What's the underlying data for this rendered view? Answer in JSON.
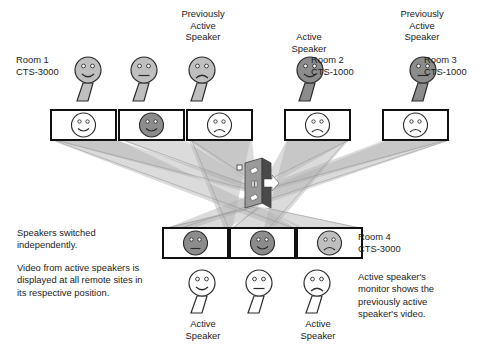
{
  "diagram": {
    "colors": {
      "light_gray": "#bfbfbf",
      "dark_gray": "#8c8c8c",
      "white": "#ffffff",
      "outline": "#2b2b2b",
      "beam": "#b8b8b8",
      "switch_dark": "#4a4a4a",
      "switch_light": "#9a9a9a"
    },
    "room_labels": [
      {
        "id": "room1",
        "text": "Room 1\nCTS-3000",
        "x": 16,
        "y": 54,
        "align": "left"
      },
      {
        "id": "room2",
        "text": "Room 2\nCTS-1000",
        "x": 311,
        "y": 54,
        "align": "left"
      },
      {
        "id": "room3",
        "text": "Room 3\nCTS-1000",
        "x": 424,
        "y": 54,
        "align": "left"
      },
      {
        "id": "room4",
        "text": "Room 4\nCTS-3000",
        "x": 358,
        "y": 231,
        "align": "left"
      }
    ],
    "speaker_captions": [
      {
        "id": "prev-active-top-mid",
        "text": "Previously\nActive\nSpeaker",
        "x": 163,
        "y": 8,
        "w": 80
      },
      {
        "id": "active-top-room2",
        "text": "Active\nSpeaker",
        "x": 269,
        "y": 31,
        "w": 80
      },
      {
        "id": "prev-active-top-room3",
        "text": "Previously\nActive\nSpeaker",
        "x": 382,
        "y": 8,
        "w": 80
      },
      {
        "id": "active-bottom-left",
        "text": "Active\nSpeaker",
        "x": 163,
        "y": 318,
        "w": 80
      },
      {
        "id": "active-bottom-right",
        "text": "Active\nSpeaker",
        "x": 278,
        "y": 318,
        "w": 80
      }
    ],
    "notes": [
      {
        "id": "note-switching",
        "text": "Speakers switched\nindependently.",
        "x": 17,
        "y": 227,
        "w": 180
      },
      {
        "id": "note-video-display",
        "text": "Video from active speakers is\ndisplayed at all remote sites in\nits respective position.",
        "x": 17,
        "y": 262,
        "w": 195
      },
      {
        "id": "note-active-monitor",
        "text": "Active speaker's\nmonitor shows the\npreviously active\nspeaker's video.",
        "x": 358,
        "y": 271,
        "w": 140
      }
    ],
    "top_people": [
      {
        "id": "person-room1",
        "x": 88,
        "y": 58,
        "fill": "light",
        "mouth": "smile"
      },
      {
        "id": "person-top-2",
        "x": 144,
        "y": 58,
        "fill": "light",
        "mouth": "neutral"
      },
      {
        "id": "person-top-3",
        "x": 202,
        "y": 58,
        "fill": "light",
        "mouth": "frown"
      },
      {
        "id": "person-room2",
        "x": 310,
        "y": 58,
        "fill": "dark",
        "mouth": "smile"
      },
      {
        "id": "person-room3",
        "x": 423,
        "y": 58,
        "fill": "dark",
        "mouth": "neutral"
      }
    ],
    "top_monitors": [
      {
        "id": "monitor-top-1",
        "x": 51,
        "y": 110,
        "face": "white",
        "mouth": "smile"
      },
      {
        "id": "monitor-top-2",
        "x": 119,
        "y": 110,
        "face": "dark",
        "mouth": "smile"
      },
      {
        "id": "monitor-top-3",
        "x": 187,
        "y": 110,
        "face": "white",
        "mouth": "frown"
      },
      {
        "id": "monitor-top-4",
        "x": 285,
        "y": 110,
        "face": "white",
        "mouth": "frown"
      },
      {
        "id": "monitor-top-5",
        "x": 383,
        "y": 110,
        "face": "white",
        "mouth": "frown"
      }
    ],
    "bottom_monitors": [
      {
        "id": "monitor-room4-1",
        "x": 163,
        "y": 228,
        "face": "dark",
        "mouth": "neutral"
      },
      {
        "id": "monitor-room4-2",
        "x": 230,
        "y": 228,
        "face": "dark",
        "mouth": "smile"
      },
      {
        "id": "monitor-room4-3",
        "x": 297,
        "y": 228,
        "face": "light",
        "mouth": "frown"
      }
    ],
    "bottom_people": [
      {
        "id": "person-bottom-1",
        "x": 202,
        "y": 275,
        "fill": "white",
        "mouth": "smile"
      },
      {
        "id": "person-bottom-2",
        "x": 259,
        "y": 275,
        "fill": "white",
        "mouth": "neutral"
      },
      {
        "id": "person-bottom-3",
        "x": 317,
        "y": 275,
        "fill": "white",
        "mouth": "frown"
      }
    ],
    "switch": {
      "id": "network-switch",
      "x": 245,
      "y": 158,
      "w": 26,
      "h": 50
    }
  }
}
